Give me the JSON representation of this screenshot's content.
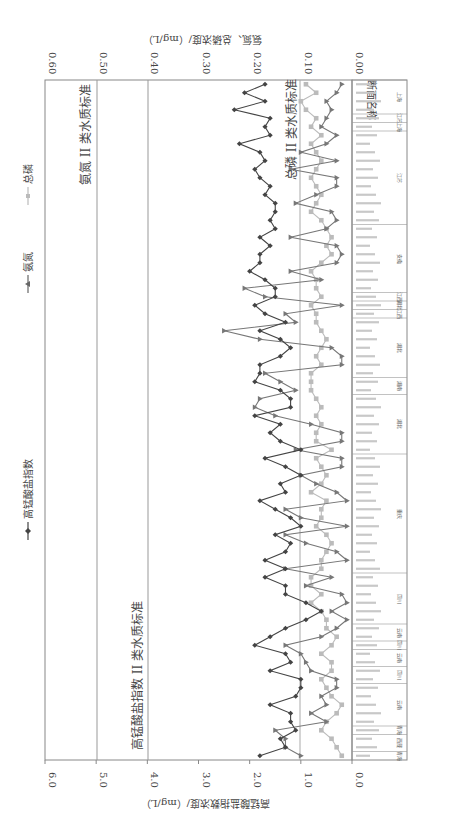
{
  "legend": {
    "cod": "高锰酸盐指数",
    "nh3": "氨氮",
    "tp": "总磷"
  },
  "axes": {
    "bottom_title": "高锰酸盐指数浓度/（mg/L）",
    "top_title": "氨氮、总磷浓度/（mg/L）",
    "category_title": "断面名称",
    "bottom_ticks": [
      "6.0",
      "5.0",
      "4.0",
      "3.0",
      "2.0",
      "1.0",
      "0.0"
    ],
    "top_ticks": [
      "0.60",
      "0.50",
      "0.40",
      "0.30",
      "0.20",
      "0.10",
      "0.00"
    ]
  },
  "reference_lines": {
    "cod_label": "高锰酸盐指数 II 类水质标准",
    "nh3_label": "氨氮 II 类水质标准",
    "tp_label": "总磷 II 类水质标准"
  },
  "provinces": [
    {
      "name": "青海",
      "start": 0,
      "end": 1
    },
    {
      "name": "西藏",
      "start": 1,
      "end": 3
    },
    {
      "name": "青海",
      "start": 3,
      "end": 4
    },
    {
      "name": "云南",
      "start": 4,
      "end": 9
    },
    {
      "name": "四川",
      "start": 9,
      "end": 11
    },
    {
      "name": "云南",
      "start": 11,
      "end": 13
    },
    {
      "name": "四川",
      "start": 13,
      "end": 14
    },
    {
      "name": "云南",
      "start": 14,
      "end": 16
    },
    {
      "name": "四川",
      "start": 16,
      "end": 22
    },
    {
      "name": "重庆",
      "start": 22,
      "end": 36
    },
    {
      "name": "湖北",
      "start": 36,
      "end": 43
    },
    {
      "name": "湖南",
      "start": 43,
      "end": 45
    },
    {
      "name": "湖北",
      "start": 45,
      "end": 52
    },
    {
      "name": "江西",
      "start": 52,
      "end": 53
    },
    {
      "name": "湖北",
      "start": 53,
      "end": 54
    },
    {
      "name": "江西",
      "start": 54,
      "end": 55
    },
    {
      "name": "安徽",
      "start": 55,
      "end": 63
    },
    {
      "name": "江苏",
      "start": 63,
      "end": 74
    },
    {
      "name": "上海",
      "start": 74,
      "end": 75
    },
    {
      "name": "江苏",
      "start": 75,
      "end": 76
    },
    {
      "name": "上海",
      "start": 76,
      "end": 80
    }
  ],
  "chart_data": {
    "type": "line",
    "title": "",
    "orientation": "rotated-90-clockwise",
    "xlabel": "断面名称",
    "ylabel": "高锰酸盐指数浓度/（mg/L）",
    "y2label": "氨氮、总磷浓度/（mg/L）",
    "ylim": [
      0,
      6.0
    ],
    "y2lim": [
      0,
      0.6
    ],
    "grid": false,
    "legend_position": "top",
    "reference_lines": [
      {
        "axis": "y",
        "value": 4.0,
        "label": "高锰酸盐指数 II 类水质标准"
      },
      {
        "axis": "y2",
        "value": 0.5,
        "label": "氨氮 II 类水质标准"
      },
      {
        "axis": "y2",
        "value": 0.1,
        "label": "总磷 II 类水质标准"
      }
    ],
    "series": [
      {
        "name": "高锰酸盐指数",
        "axis": "y",
        "marker": "diamond",
        "color": "#444444",
        "values": [
          1.8,
          1.3,
          1.4,
          1.1,
          1.2,
          1.2,
          1.6,
          1.1,
          1.0,
          1.0,
          1.6,
          1.2,
          1.3,
          1.9,
          1.6,
          1.3,
          0.9,
          0.6,
          0.9,
          1.3,
          1.3,
          1.7,
          1.3,
          1.7,
          1.3,
          1.2,
          1.5,
          1.0,
          1.2,
          1.5,
          1.8,
          1.3,
          1.4,
          1.0,
          1.3,
          1.7,
          1.0,
          1.4,
          1.6,
          1.4,
          1.9,
          1.2,
          1.2,
          1.4,
          1.9,
          1.8,
          1.8,
          1.4,
          1.2,
          1.4,
          1.8,
          1.3,
          1.7,
          1.9,
          1.5,
          1.5,
          1.7,
          2.0,
          1.8,
          1.8,
          1.6,
          1.8,
          1.5,
          1.6,
          1.5,
          1.5,
          1.7,
          1.6,
          1.8,
          1.9,
          1.7,
          1.8,
          2.2,
          1.6,
          1.7,
          1.6,
          2.3,
          1.7,
          2.1,
          1.7
        ]
      },
      {
        "name": "氨氮",
        "axis": "y2",
        "marker": "triangle",
        "color": "#777777",
        "values": [
          0.1,
          0.13,
          0.13,
          0.15,
          0.05,
          0.08,
          0.05,
          0.06,
          0.03,
          0.03,
          0.08,
          0.09,
          0.1,
          0.13,
          0.06,
          0.03,
          0.01,
          0.04,
          0.01,
          0.02,
          0.09,
          0.04,
          0.13,
          0.01,
          0.03,
          0.09,
          0.13,
          0.01,
          0.1,
          0.13,
          0.01,
          0.03,
          0.07,
          0.1,
          0.02,
          0.02,
          0.11,
          0.02,
          0.02,
          0.08,
          0.15,
          0.19,
          0.18,
          0.11,
          0.14,
          0.17,
          0.02,
          0.02,
          0.04,
          0.18,
          0.25,
          0.11,
          0.13,
          0.02,
          0.17,
          0.21,
          0.06,
          0.12,
          0.03,
          0.02,
          0.03,
          0.12,
          0.05,
          0.03,
          0.04,
          0.11,
          0.07,
          0.03,
          0.03,
          0.12,
          0.03,
          0.1,
          0.05,
          0.03,
          0.06,
          0.05,
          0.04,
          0.05,
          0.03,
          0.02
        ]
      },
      {
        "name": "总磷",
        "axis": "y2",
        "marker": "square",
        "color": "#bbbbbb",
        "values": [
          0.02,
          0.03,
          0.04,
          0.06,
          0.05,
          0.03,
          0.02,
          0.04,
          0.05,
          0.06,
          0.04,
          0.04,
          0.06,
          0.04,
          0.03,
          0.05,
          0.05,
          0.06,
          0.08,
          0.06,
          0.08,
          0.08,
          0.06,
          0.06,
          0.05,
          0.04,
          0.05,
          0.07,
          0.06,
          0.06,
          0.05,
          0.08,
          0.06,
          0.05,
          0.06,
          0.07,
          0.04,
          0.07,
          0.07,
          0.06,
          0.07,
          0.06,
          0.07,
          0.08,
          0.08,
          0.08,
          0.06,
          0.07,
          0.06,
          0.05,
          0.06,
          0.07,
          0.07,
          0.08,
          0.06,
          0.07,
          0.07,
          0.08,
          0.06,
          0.04,
          0.05,
          0.04,
          0.05,
          0.06,
          0.08,
          0.07,
          0.06,
          0.07,
          0.08,
          0.07,
          0.06,
          0.07,
          0.08,
          0.06,
          0.08,
          0.07,
          0.09,
          0.1,
          0.07,
          0.09
        ]
      }
    ]
  }
}
